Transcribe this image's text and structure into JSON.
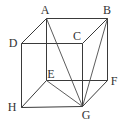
{
  "diagram": {
    "type": "cube",
    "line_color": "#3a3a3a",
    "background": "#ffffff",
    "vertices": {
      "A": {
        "label": "A",
        "x": 46,
        "y": 18,
        "lx": 45,
        "ly": 14,
        "anchor": "middle"
      },
      "B": {
        "label": "B",
        "x": 107,
        "y": 18,
        "lx": 107,
        "ly": 14,
        "anchor": "middle"
      },
      "C": {
        "label": "C",
        "x": 82,
        "y": 43,
        "lx": 77,
        "ly": 40,
        "anchor": "middle"
      },
      "D": {
        "label": "D",
        "x": 21,
        "y": 43,
        "lx": 13,
        "ly": 47,
        "anchor": "middle"
      },
      "E": {
        "label": "E",
        "x": 46,
        "y": 80,
        "lx": 51,
        "ly": 78,
        "anchor": "middle"
      },
      "F": {
        "label": "F",
        "x": 107,
        "y": 80,
        "lx": 114,
        "ly": 85,
        "anchor": "middle"
      },
      "G": {
        "label": "G",
        "x": 82,
        "y": 106,
        "lx": 86,
        "ly": 119,
        "anchor": "middle"
      },
      "H": {
        "label": "H",
        "x": 21,
        "y": 107,
        "lx": 12,
        "ly": 111,
        "anchor": "middle"
      }
    },
    "edges": [
      [
        "A",
        "B"
      ],
      [
        "B",
        "C"
      ],
      [
        "C",
        "D"
      ],
      [
        "D",
        "A"
      ],
      [
        "E",
        "F"
      ],
      [
        "F",
        "G"
      ],
      [
        "G",
        "H"
      ],
      [
        "H",
        "E"
      ],
      [
        "A",
        "E"
      ],
      [
        "B",
        "F"
      ],
      [
        "C",
        "G"
      ],
      [
        "D",
        "H"
      ]
    ],
    "diagonals": [
      [
        "A",
        "G"
      ],
      [
        "B",
        "G"
      ],
      [
        "E",
        "G"
      ]
    ]
  }
}
